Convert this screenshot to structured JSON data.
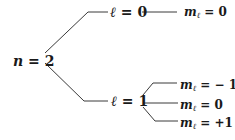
{
  "diagram": {
    "type": "tree",
    "title": "",
    "root": {
      "var": "n",
      "eq": " = ",
      "value": "2"
    },
    "branches": [
      {
        "var": "ℓ",
        "eq": " = ",
        "value": "0",
        "children": [
          {
            "var": "m",
            "subscript": "ℓ",
            "eq": " = ",
            "value": "0"
          }
        ]
      },
      {
        "var": "ℓ",
        "eq": " = ",
        "value": "1",
        "children": [
          {
            "var": "m",
            "subscript": "ℓ",
            "eq": " = ",
            "value": "− 1"
          },
          {
            "var": "m",
            "subscript": "ℓ",
            "eq": " = ",
            "value": "0"
          },
          {
            "var": "m",
            "subscript": "ℓ",
            "eq": " = ",
            "value": "+1"
          }
        ]
      }
    ],
    "line_color": "#3a3a3a",
    "text_color": "#1a1a1a"
  }
}
